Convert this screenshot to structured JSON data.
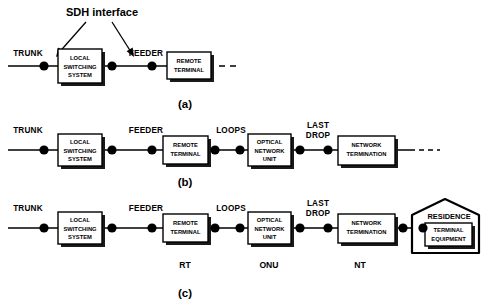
{
  "figure": {
    "callout": {
      "text": "SDH interface",
      "arrow_left_name": "sdh-arrow-left",
      "arrow_right_name": "sdh-arrow-right"
    },
    "panels": [
      {
        "id": "a",
        "label": "(a)",
        "link_labels": [
          "TRUNK",
          "FEEDER"
        ],
        "boxes": [
          {
            "id": "lss",
            "lines": [
              "LOCAL",
              "SWITCHING",
              "SYSTEM"
            ]
          },
          {
            "id": "rt",
            "lines": [
              "REMOTE",
              "TERMINAL"
            ]
          }
        ],
        "abbr_labels": [],
        "has_trailing_dashes": true
      },
      {
        "id": "b",
        "label": "(b)",
        "link_labels": [
          "TRUNK",
          "FEEDER",
          "LOOPS",
          "LAST DROP"
        ],
        "boxes": [
          {
            "id": "lss",
            "lines": [
              "LOCAL",
              "SWITCHING",
              "SYSTEM"
            ]
          },
          {
            "id": "rt",
            "lines": [
              "REMOTE",
              "TERMINAL"
            ]
          },
          {
            "id": "onu",
            "lines": [
              "OPTICAL",
              "NETWORK",
              "UNIT"
            ]
          },
          {
            "id": "nt",
            "lines": [
              "NETWORK",
              "TERMINATION"
            ]
          }
        ],
        "abbr_labels": [],
        "has_trailing_dashes": true
      },
      {
        "id": "c",
        "label": "(c)",
        "link_labels": [
          "TRUNK",
          "FEEDER",
          "LOOPS",
          "LAST DROP"
        ],
        "boxes": [
          {
            "id": "lss",
            "lines": [
              "LOCAL",
              "SWITCHING",
              "SYSTEM"
            ]
          },
          {
            "id": "rt",
            "lines": [
              "REMOTE",
              "TERMINAL"
            ]
          },
          {
            "id": "onu",
            "lines": [
              "OPTICAL",
              "NETWORK",
              "UNIT"
            ]
          },
          {
            "id": "nt",
            "lines": [
              "NETWORK",
              "TERMINATION"
            ]
          },
          {
            "id": "te",
            "lines": [
              "TERMINAL",
              "EQUIPMENT"
            ]
          }
        ],
        "abbr_labels": [
          "RT",
          "ONU",
          "NT"
        ],
        "residence_label": "RESIDENCE",
        "has_trailing_dashes": false
      }
    ],
    "colors": {
      "stroke": "#000000",
      "fill": "#ffffff",
      "shadow": "#1a1a1a",
      "background": "#ffffff"
    }
  },
  "labels": {
    "trunk": "TRUNK",
    "feeder": "FEEDER",
    "loops": "LOOPS",
    "last_drop_line1": "LAST",
    "last_drop_line2": "DROP",
    "rt": "RT",
    "onu": "ONU",
    "nt": "NT",
    "residence": "RESIDENCE",
    "panel_a": "(a)",
    "panel_b": "(b)",
    "panel_c": "(c)",
    "sdh": "SDH interface",
    "lss_1": "LOCAL",
    "lss_2": "SWITCHING",
    "lss_3": "SYSTEM",
    "rtbox_1": "REMOTE",
    "rtbox_2": "TERMINAL",
    "onu_1": "OPTICAL",
    "onu_2": "NETWORK",
    "onu_3": "UNIT",
    "nt_1": "NETWORK",
    "nt_2": "TERMINATION",
    "te_1": "TERMINAL",
    "te_2": "EQUIPMENT"
  }
}
